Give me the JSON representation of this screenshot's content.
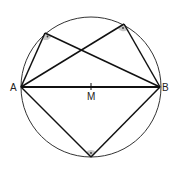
{
  "diagram": {
    "circle": {
      "cx": 91,
      "cy": 87,
      "r": 70,
      "stroke": "#333333"
    },
    "points": {
      "A": {
        "x": 21,
        "y": 87,
        "label": "A"
      },
      "B": {
        "x": 160,
        "y": 87,
        "label": "B"
      },
      "M": {
        "x": 91,
        "y": 87,
        "label": "M"
      },
      "C1": {
        "x": 45,
        "y": 33
      },
      "C2": {
        "x": 124,
        "y": 24
      },
      "C3": {
        "x": 91,
        "y": 157
      }
    },
    "right_angle_fill": "#c8c8c8",
    "line_color": "#111111"
  }
}
